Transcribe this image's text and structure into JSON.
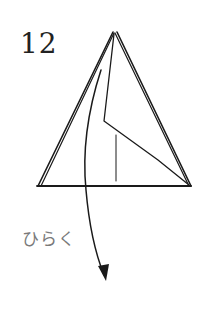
{
  "diagram": {
    "step_number": "12",
    "instruction": "ひらく",
    "colors": {
      "line": "#1a1a1a",
      "text_step": "#222222",
      "text_instruction": "#7a7a7a",
      "background": "#ffffff"
    },
    "elements": [
      {
        "type": "folded-triangle",
        "description": "origami model, triangular shape with layered edges"
      },
      {
        "type": "inner-crease",
        "description": "fold line from apex to middle then to lower right"
      },
      {
        "type": "vertical-mark",
        "description": "short vertical reference line"
      },
      {
        "type": "curved-arrow",
        "description": "arrow indicating opening the flap downward"
      }
    ]
  }
}
